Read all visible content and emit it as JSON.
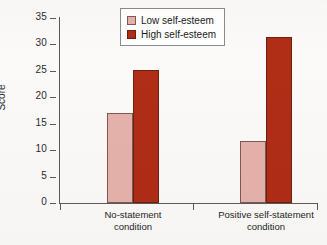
{
  "chart_data": {
    "type": "bar",
    "title": "",
    "xlabel": "",
    "ylabel": "Score",
    "ylim": [
      0,
      35
    ],
    "yticks": [
      0,
      5,
      10,
      15,
      20,
      25,
      30,
      35
    ],
    "grid": false,
    "legend_position": "top-center",
    "categories": [
      "No-statement condition",
      "Positive self-statement condition"
    ],
    "category_lines": [
      [
        "No-statement",
        "condition"
      ],
      [
        "Positive self-statement",
        "condition"
      ]
    ],
    "series": [
      {
        "name": "Low self-esteem",
        "color": "#e5b2ab",
        "values": [
          17.0,
          11.8
        ]
      },
      {
        "name": "High self-esteem",
        "color": "#b02d16",
        "values": [
          25.2,
          31.4
        ]
      }
    ]
  },
  "legend": {
    "items": [
      {
        "label": "Low self-esteem"
      },
      {
        "label": "High self-esteem"
      }
    ]
  },
  "axis": {
    "y_title": "Score",
    "y_tick_labels": [
      "35",
      "30",
      "25",
      "20",
      "15",
      "10",
      "5",
      "0"
    ]
  }
}
